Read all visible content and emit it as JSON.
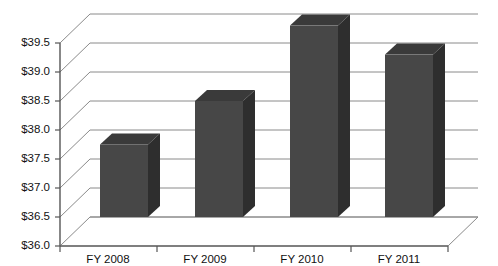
{
  "chart_data": {
    "type": "bar",
    "title": "",
    "subtitle": "",
    "xlabel": "",
    "ylabel": "",
    "categories": [
      "FY 2008",
      "FY 2009",
      "FY 2010",
      "FY 2011"
    ],
    "values": [
      37.25,
      38.0,
      39.3,
      38.8
    ],
    "value_prefix": "$",
    "ylim": [
      36.0,
      39.5
    ],
    "ytick_labels": [
      "$36.0",
      "$36.5",
      "$37.0",
      "$37.5",
      "$38.0",
      "$38.5",
      "$39.0",
      "$39.5"
    ],
    "ytick_values": [
      36.0,
      36.5,
      37.0,
      37.5,
      38.0,
      38.5,
      39.0,
      39.5
    ],
    "grid": true,
    "legend": false,
    "legend_position": "none",
    "style": "3d-column",
    "colors": {
      "bar_front": "#474747",
      "bar_side": "#2e2e2e",
      "bar_top": "#3a3a3a",
      "grid": "#8a8a8a",
      "axis": "#555555",
      "background": "#ffffff",
      "text": "#111111"
    }
  }
}
